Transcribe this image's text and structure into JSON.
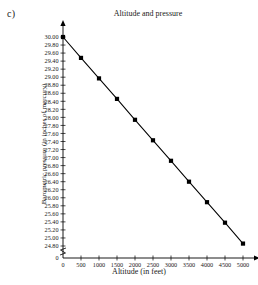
{
  "part_label": "c)",
  "chart_data": {
    "type": "line",
    "title": "Altitude and pressure",
    "xlabel": "Altitude (in feet)",
    "ylabel": "Barometric pressure (in inches of mercury)",
    "x": [
      0,
      500,
      1000,
      1500,
      2000,
      2500,
      3000,
      3500,
      4000,
      4500,
      5000
    ],
    "values": [
      30.0,
      29.48,
      28.97,
      28.46,
      27.94,
      27.43,
      26.92,
      26.4,
      25.89,
      25.38,
      24.86
    ],
    "series": [
      {
        "name": "Barometric pressure",
        "values": [
          30.0,
          29.48,
          28.97,
          28.46,
          27.94,
          27.43,
          26.92,
          26.4,
          25.89,
          25.38,
          24.86
        ]
      }
    ],
    "xlim": [
      0,
      5000
    ],
    "ylim": [
      24.8,
      30.0
    ],
    "xticks": [
      0,
      500,
      1000,
      1500,
      2000,
      2500,
      3000,
      3500,
      4000,
      4500,
      5000
    ],
    "xtick_labels": [
      "0",
      "500",
      "1000",
      "1500",
      "2000",
      "2500",
      "3000",
      "3500",
      "4000",
      "4500",
      "5000"
    ],
    "yticks": [
      24.8,
      25.0,
      25.2,
      25.4,
      25.6,
      25.8,
      26.0,
      26.2,
      26.4,
      26.6,
      26.8,
      27.0,
      27.2,
      27.4,
      27.6,
      27.8,
      28.0,
      28.2,
      28.4,
      28.6,
      28.8,
      29.0,
      29.2,
      29.4,
      29.6,
      29.8,
      30.0
    ],
    "ytick_labels": [
      "24.80",
      "25.00",
      "25.20",
      "25.40",
      "25.60",
      "25.80",
      "26.00",
      "26.20",
      "26.40",
      "26.60",
      "26.80",
      "27.00",
      "27.20",
      "27.40",
      "27.60",
      "27.80",
      "28.00",
      "28.20",
      "28.40",
      "28.60",
      "28.80",
      "29.00",
      "29.20",
      "29.40",
      "29.60",
      "29.80",
      "30.00"
    ],
    "y_origin_label": "0",
    "x_origin_label": "0",
    "axis_break": true,
    "grid": false,
    "legend": false,
    "marker": "square",
    "color": "#000000"
  }
}
